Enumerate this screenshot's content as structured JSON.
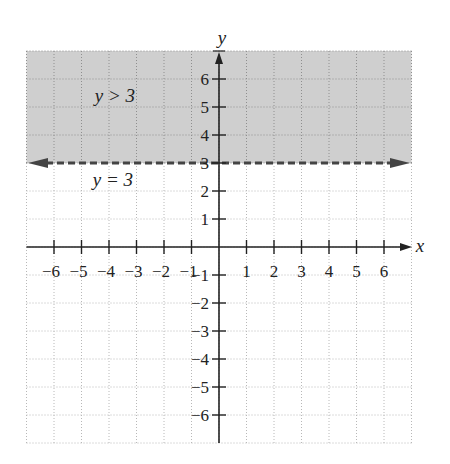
{
  "chart_data": {
    "type": "inequality-graph",
    "title": "",
    "xlabel": "x",
    "ylabel": "y",
    "xlim": [
      -7,
      7
    ],
    "ylim": [
      -7,
      7
    ],
    "grid": true,
    "x_ticks": [
      -6,
      -5,
      -4,
      -3,
      -2,
      -1,
      1,
      2,
      3,
      4,
      5,
      6
    ],
    "y_ticks": [
      -6,
      -5,
      -4,
      -3,
      -2,
      -1,
      1,
      2,
      3,
      4,
      5,
      6
    ],
    "x_tick_labels": [
      "−6",
      "−5",
      "−4",
      "−3",
      "−2",
      "−1",
      "1",
      "2",
      "3",
      "4",
      "5",
      "6"
    ],
    "y_tick_labels": [
      "−6",
      "−5",
      "−4",
      "−3",
      "−2",
      "−1",
      "1",
      "2",
      "3",
      "4",
      "5",
      "6"
    ],
    "boundary_line": {
      "equation": "y = 3",
      "y": 3,
      "style": "dashed",
      "arrows": "both"
    },
    "shaded_region": {
      "inequality": "y > 3",
      "from_y": 3,
      "to_y": 7
    },
    "annotations": [
      {
        "text": "y > 3",
        "x": -4,
        "y": 5.5
      },
      {
        "text": "y = 3",
        "x": -4,
        "y": 2.4
      }
    ]
  },
  "colors": {
    "shade": "#cfcfcf",
    "grid_on_shade": "#8f8f8f",
    "grid": "#b8b8b8",
    "axis": "#222222",
    "boundary": "#444444"
  },
  "labels": {
    "x_axis": "x",
    "y_axis": "y",
    "region_label": "y > 3",
    "line_label": "y = 3"
  }
}
